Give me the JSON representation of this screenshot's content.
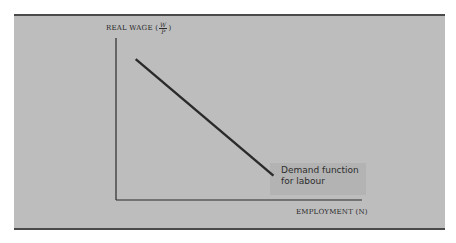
{
  "chart_data": {
    "type": "line",
    "title": "",
    "ylabel": "REAL WAGE",
    "ylabel_fraction": {
      "numerator": "W",
      "denominator": "P"
    },
    "xlabel": "EMPLOYMENT (N)",
    "xlim": [
      0,
      1
    ],
    "ylim": [
      0,
      1
    ],
    "grid": false,
    "series": [
      {
        "name": "Demand function for labour",
        "x": [
          0.08,
          0.64
        ],
        "y": [
          0.87,
          0.15
        ]
      }
    ],
    "annotations": [
      {
        "text": "Demand function\nfor labour",
        "attached_to": "series end"
      }
    ],
    "colors": {
      "background": "#bdbdbd",
      "line": "#2a2a2a",
      "border": "#4a4a4a"
    }
  }
}
